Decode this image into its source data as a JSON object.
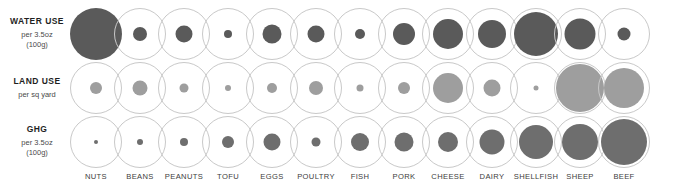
{
  "colors": {
    "water": "#5a5a5a",
    "land": "#9e9e9e",
    "ghg": "#6e6e6e",
    "ring": "#c9c9c9",
    "background": "#ffffff",
    "label_text": "#1f1f1f",
    "unit_text": "#4a4a4a",
    "column_text": "#3d3d3d"
  },
  "rows": [
    {
      "key": "water",
      "title": "WATER USE",
      "unit_line1": "per 3.5oz",
      "unit_line2": "(100g)",
      "color": "#5a5a5a"
    },
    {
      "key": "land",
      "title": "LAND USE",
      "unit_line1": "per sq yard",
      "unit_line2": "",
      "color": "#9e9e9e"
    },
    {
      "key": "ghg",
      "title": "GHG",
      "unit_line1": "per 3.5oz",
      "unit_line2": "(100g)",
      "color": "#6e6e6e"
    }
  ],
  "columns": [
    "NUTS",
    "BEANS",
    "PEANUTS",
    "TOFU",
    "EGGS",
    "POULTRY",
    "FISH",
    "PORK",
    "CHEESE",
    "DAIRY",
    "SHELLFISH",
    "SHEEP",
    "BEEF"
  ],
  "chart_data": {
    "type": "bubble",
    "xlabel": "",
    "ylabel": "",
    "grid": false,
    "legend": "none",
    "categories": [
      "NUTS",
      "BEANS",
      "PEANUTS",
      "TOFU",
      "EGGS",
      "POULTRY",
      "FISH",
      "PORK",
      "CHEESE",
      "DAIRY",
      "SHELLFISH",
      "SHEEP",
      "BEEF"
    ],
    "ring_diameter_px": 52,
    "series": [
      {
        "name": "WATER USE",
        "unit": "per 3.5oz (100g)",
        "color": "#5a5a5a",
        "bubble_diameter_px": [
          52,
          14,
          17,
          8,
          19,
          17,
          10,
          22,
          30,
          28,
          44,
          31,
          13
        ]
      },
      {
        "name": "LAND USE",
        "unit": "per sq yard",
        "color": "#9e9e9e",
        "bubble_diameter_px": [
          12,
          15,
          9,
          6,
          10,
          14,
          7,
          12,
          30,
          17,
          5,
          48,
          40
        ]
      },
      {
        "name": "GHG",
        "unit": "per 3.5oz (100g)",
        "color": "#6e6e6e",
        "bubble_diameter_px": [
          4,
          6,
          8,
          12,
          17,
          9,
          18,
          19,
          20,
          25,
          34,
          36,
          46
        ]
      }
    ]
  },
  "layout": {
    "column_centers_px": [
      96,
      140,
      184,
      228,
      272,
      316,
      360,
      404,
      448,
      492,
      536,
      580,
      624
    ],
    "row_centers_px": [
      34,
      88,
      142
    ],
    "column_label_y_px": 172
  }
}
